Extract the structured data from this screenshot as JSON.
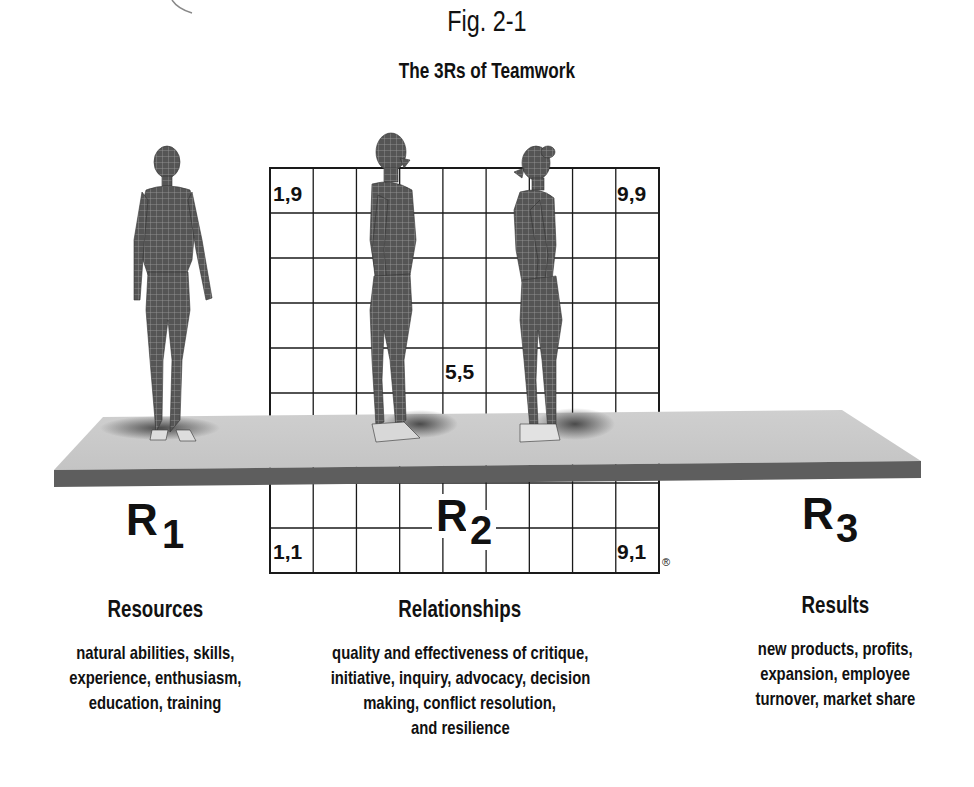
{
  "figure": {
    "label": "Fig. 2-1",
    "title": "The 3Rs of Teamwork"
  },
  "grid": {
    "columns": 9,
    "rows": 9,
    "corner_labels": {
      "top_left": "1,9",
      "top_right": "9,9",
      "center": "5,5",
      "bottom_left": "1,1",
      "bottom_right": "9,1"
    },
    "registered_mark": "®"
  },
  "figures": [
    {
      "name": "figure-woman-front",
      "description": "wireframe female figure facing forward, standing on platform under R1"
    },
    {
      "name": "figure-man-profile",
      "description": "wireframe male figure in profile facing right"
    },
    {
      "name": "figure-woman-profile",
      "description": "wireframe female figure in profile facing left"
    }
  ],
  "r_labels": [
    {
      "letter": "R",
      "subscript": "1"
    },
    {
      "letter": "R",
      "subscript": "2"
    },
    {
      "letter": "R",
      "subscript": "3"
    }
  ],
  "columns": [
    {
      "heading": "Resources",
      "lines": [
        "natural abilities, skills,",
        "experience, enthusiasm,",
        "education, training"
      ]
    },
    {
      "heading": "Relationships",
      "lines": [
        "quality and effectiveness of critique,",
        "initiative, inquiry, advocacy, decision",
        "making, conflict resolution,",
        "and resilience"
      ]
    },
    {
      "heading": "Results",
      "lines": [
        "new products, profits,",
        "expansion, employee",
        "turnover, market share"
      ]
    }
  ],
  "colors": {
    "grid_line": "#1a1a1a",
    "platform_top": "#c9c9c9",
    "platform_front": "#5e5e5e",
    "figure_fill": "#4a4a4a",
    "text": "#111111"
  }
}
